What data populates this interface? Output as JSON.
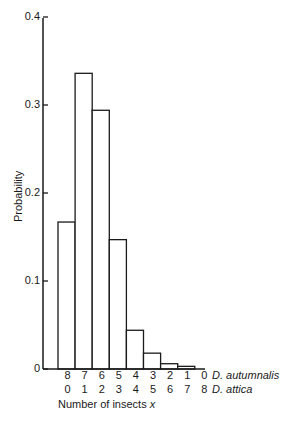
{
  "chart_data": {
    "type": "bar",
    "title": "",
    "xlabel": "Number of insects x",
    "ylabel": "Probability",
    "ylim": [
      0,
      0.4
    ],
    "yticks": [
      "0",
      "0.1",
      "0.2",
      "0.3",
      "0.4"
    ],
    "grid": false,
    "categories_series": [
      {
        "name": "D. autumnalis",
        "labels": [
          "8",
          "7",
          "6",
          "5",
          "4",
          "3",
          "2",
          "1",
          "0"
        ]
      },
      {
        "name": "D. attica",
        "labels": [
          "0",
          "1",
          "2",
          "3",
          "4",
          "5",
          "6",
          "7",
          "8"
        ]
      }
    ],
    "values": [
      0.167,
      0.336,
      0.294,
      0.147,
      0.044,
      0.018,
      0.006,
      0.003,
      0.0
    ],
    "legend_position": "right of x tick rows"
  },
  "axis": {
    "y_label": "Probability",
    "x_label_text": "Number of insects ",
    "x_label_var": "x",
    "ticks": [
      {
        "label": "0.4",
        "value": 0.4
      },
      {
        "label": "0.3",
        "value": 0.3
      },
      {
        "label": "0.2",
        "value": 0.2
      },
      {
        "label": "0.1",
        "value": 0.1
      },
      {
        "label": "0",
        "value": 0
      }
    ]
  },
  "rows": {
    "autumnalis": {
      "name": "D. autumnalis",
      "labels": [
        "8",
        "7",
        "6",
        "5",
        "4",
        "3",
        "2",
        "1",
        "0"
      ]
    },
    "attica": {
      "name": "D. attica",
      "labels": [
        "0",
        "1",
        "2",
        "3",
        "4",
        "5",
        "6",
        "7",
        "8"
      ]
    }
  }
}
